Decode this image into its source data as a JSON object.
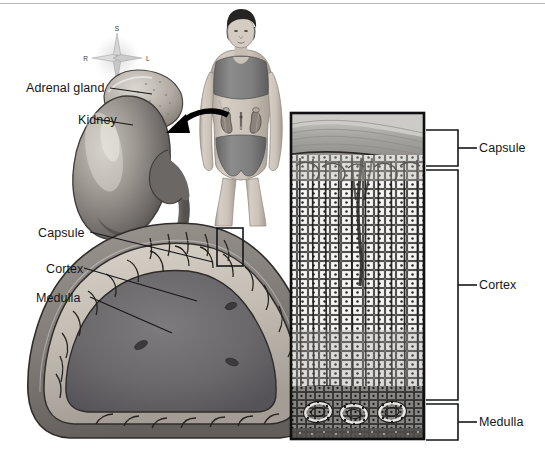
{
  "figure": {
    "background_color": "#ffffff",
    "ink_color": "#15161a",
    "width": 545,
    "height": 461
  },
  "orientation_compass": {
    "name": "anatomical-orientation-rose",
    "superior": "S",
    "inferior": "I",
    "right": "R",
    "left": "L",
    "center_x": 117,
    "center_y": 58
  },
  "panels": {
    "whole_organ": {
      "name": "adrenal-gland-and-kidney-illustration",
      "labels": [
        {
          "id": "adrenal-gland",
          "text": "Adrenal gland",
          "x": 26,
          "y": 81,
          "leader_to_x": 150,
          "leader_to_y": 90
        },
        {
          "id": "kidney",
          "text": "Kidney",
          "x": 50,
          "y": 113,
          "leader_to_x": 132,
          "leader_to_y": 124
        }
      ]
    },
    "body_figure": {
      "name": "female-body-figure",
      "description": "anterior view of woman with kidneys and adrenal glands shown in lower torso",
      "skin_color": "#cfc6bd",
      "garment_color": "#7d7d7d",
      "hair_color": "#2b2b2b"
    },
    "pointer_arrow": {
      "name": "body-to-organ-arrow",
      "from_x": 232,
      "from_y": 117,
      "to_x": 168,
      "to_y": 138
    },
    "cross_section": {
      "name": "adrenal-gland-cross-section",
      "labels": [
        {
          "id": "capsule",
          "text": "Capsule",
          "x": 38,
          "y": 229,
          "leader_to_x": 212,
          "leader_to_y": 262
        },
        {
          "id": "cortex",
          "text": "Cortex",
          "x": 48,
          "y": 265,
          "leader_to_x": 196,
          "leader_to_y": 300
        },
        {
          "id": "medulla",
          "text": "Medulla",
          "x": 38,
          "y": 294,
          "leader_to_x": 170,
          "leader_to_y": 332
        }
      ],
      "callout_box": {
        "x": 217,
        "y": 228,
        "width": 26,
        "height": 38
      },
      "capsule_color": "#7f7b78",
      "cortex_color": "#c9c3bb",
      "medulla_color": "#6f6c70"
    },
    "histology": {
      "name": "adrenal-histology-panel",
      "x": 290,
      "y": 112,
      "width": 135,
      "height": 328,
      "zones": [
        {
          "id": "capsule",
          "label": "Capsule",
          "top": 112,
          "bottom": 158
        },
        {
          "id": "cortex",
          "label": "Cortex",
          "top": 158,
          "bottom": 388
        },
        {
          "id": "medulla",
          "label": "Medulla",
          "top": 388,
          "bottom": 440
        }
      ],
      "brackets": [
        {
          "id": "capsule-bracket",
          "label": "Capsule",
          "top": 130,
          "bottom": 166,
          "label_x": 483,
          "label_y": 141
        },
        {
          "id": "cortex-bracket",
          "label": "Cortex",
          "top": 170,
          "bottom": 400,
          "label_x": 483,
          "label_y": 278
        },
        {
          "id": "medulla-bracket",
          "label": "Medulla",
          "top": 404,
          "bottom": 440,
          "label_x": 483,
          "label_y": 416
        }
      ]
    }
  },
  "all_text_labels": [
    "S",
    "I",
    "R",
    "L",
    "Adrenal gland",
    "Kidney",
    "Capsule",
    "Cortex",
    "Medulla",
    "Capsule",
    "Cortex",
    "Medulla"
  ]
}
